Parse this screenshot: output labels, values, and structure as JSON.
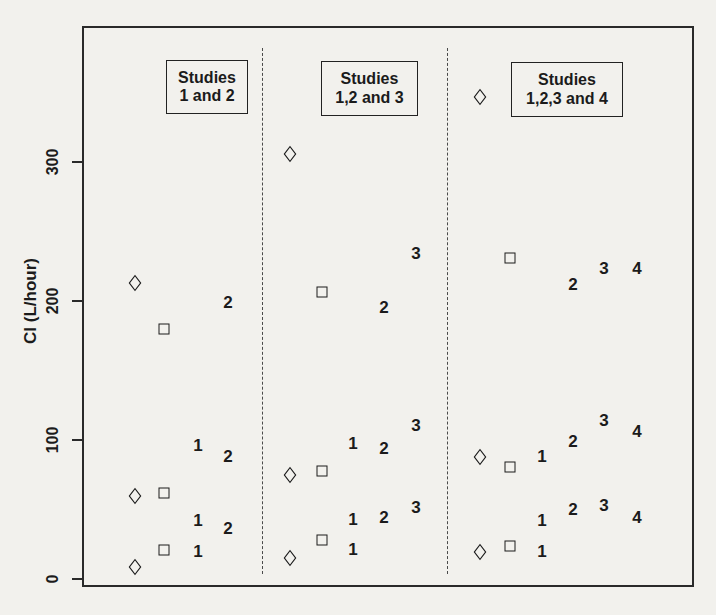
{
  "colors": {
    "ink": "#1b1b1b",
    "background": "#f2f1ed"
  },
  "chart_data": {
    "type": "scatter",
    "title": "",
    "xlabel": "",
    "ylabel": "Cl (L/hour)",
    "ylim": [
      0,
      400
    ],
    "yticks": [
      0,
      100,
      200,
      300
    ],
    "grid": false,
    "legend_position": "top-inside-per-panel",
    "panels": [
      {
        "legend_lines": [
          "Studies",
          "1 and 2"
        ],
        "columns": [
          {
            "symbol": "diamond",
            "x_px": 135,
            "values": [
              213,
              60,
              9
            ]
          },
          {
            "symbol": "square",
            "x_px": 164,
            "values": [
              180,
              62,
              21
            ]
          },
          {
            "symbol": "1",
            "x_px": 198,
            "values": [
              96,
              42,
              20
            ]
          },
          {
            "symbol": "2",
            "x_px": 228,
            "values": [
              199,
              88,
              36
            ]
          }
        ]
      },
      {
        "legend_lines": [
          "Studies",
          "1,2 and 3"
        ],
        "columns": [
          {
            "symbol": "diamond",
            "x_px": 290,
            "values": [
              306,
              75,
              15
            ]
          },
          {
            "symbol": "square",
            "x_px": 322,
            "values": [
              207,
              78,
              28
            ]
          },
          {
            "symbol": "1",
            "x_px": 353,
            "values": [
              97,
              43,
              21
            ]
          },
          {
            "symbol": "2",
            "x_px": 384,
            "values": [
              195,
              94,
              44
            ]
          },
          {
            "symbol": "3",
            "x_px": 416,
            "values": [
              234,
              110,
              51
            ]
          }
        ]
      },
      {
        "legend_lines": [
          "Studies",
          "1,2,3 and 4"
        ],
        "columns": [
          {
            "symbol": "diamond",
            "x_px": 480,
            "values": [
              347,
              88,
              20
            ]
          },
          {
            "symbol": "square",
            "x_px": 510,
            "values": [
              231,
              81,
              24
            ]
          },
          {
            "symbol": "1",
            "x_px": 542,
            "values": [
              88,
              42,
              20
            ]
          },
          {
            "symbol": "2",
            "x_px": 573,
            "values": [
              212,
              99,
              50
            ]
          },
          {
            "symbol": "3",
            "x_px": 604,
            "values": [
              223,
              114,
              53
            ]
          },
          {
            "symbol": "4",
            "x_px": 637,
            "values": [
              223,
              106,
              44
            ]
          }
        ]
      }
    ]
  }
}
